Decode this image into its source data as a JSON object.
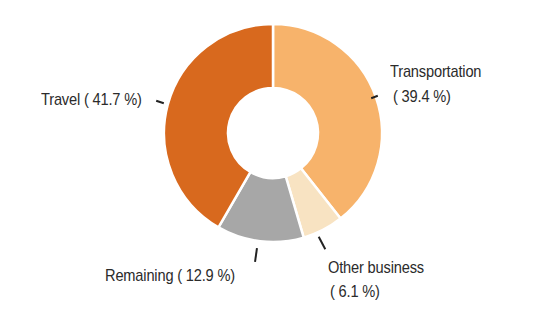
{
  "chart_data": {
    "type": "pie",
    "variant": "donut",
    "title": "",
    "categories": [
      "Transportation",
      "Other business",
      "Remaining",
      "Travel"
    ],
    "values": [
      39.4,
      6.1,
      12.9,
      41.7
    ],
    "unit": "%",
    "colors": [
      "#f7b36b",
      "#f8e3c2",
      "#a7a7a7",
      "#d8691e"
    ],
    "start_angle": "12 o'clock, clockwise",
    "labels": [
      {
        "name": "Transportation",
        "value_text": "( 39.4 %)"
      },
      {
        "name": "Other business",
        "value_text": "(  6.1 %)"
      },
      {
        "name": "Remaining",
        "value_text": "Remaining ( 12.9 %)"
      },
      {
        "name": "Travel",
        "value_text": "Travel ( 41.7 %)"
      }
    ],
    "legend": "none (direct labels)"
  },
  "labels": {
    "transportation_name": "Transportation",
    "transportation_value": "( 39.4 %)",
    "other_name": "Other business",
    "other_value": "(  6.1 %)",
    "remaining": "Remaining ( 12.9 %)",
    "travel": "Travel ( 41.7 %)"
  }
}
